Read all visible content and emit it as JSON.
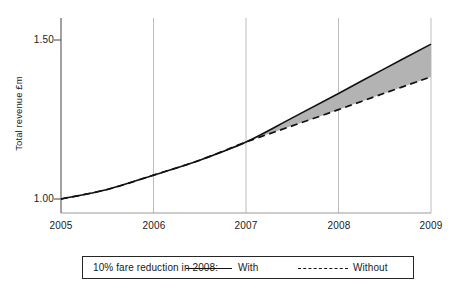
{
  "chart_data": {
    "type": "line",
    "title": "",
    "xlabel": "",
    "ylabel": "Total revenue £m",
    "xlim": [
      2005,
      2009
    ],
    "ylim": [
      0.95,
      1.56
    ],
    "grid": "vertical-only",
    "yticks": [
      1.0,
      1.5
    ],
    "ytick_labels": [
      "1.00",
      "1.50"
    ],
    "xticks": [
      2005,
      2006,
      2007,
      2008,
      2009
    ],
    "xtick_labels": [
      "2005",
      "2006",
      "2007",
      "2008",
      "2009"
    ],
    "legend_position": "below-plot-boxed",
    "shaded_region": {
      "label": "difference between With and Without",
      "fill_color": "#b3b3b3",
      "x_start": 2007,
      "x_end": 2009
    },
    "x": [
      2005,
      2005.5,
      2006,
      2006.5,
      2007,
      2007.5,
      2008,
      2008.5,
      2009
    ],
    "series": [
      {
        "name": "With",
        "style": "solid",
        "color": "#111111",
        "values": [
          1.0,
          1.03,
          1.075,
          1.122,
          1.179,
          1.255,
          1.332,
          1.41,
          1.487
        ]
      },
      {
        "name": "Without",
        "style": "dashed",
        "color": "#111111",
        "values": [
          1.0,
          1.03,
          1.075,
          1.122,
          1.179,
          1.23,
          1.281,
          1.333,
          1.384
        ]
      }
    ],
    "annotations": []
  },
  "legend": {
    "title": "10% fare reduction in 2008:",
    "with_label": "With",
    "without_label": "Without"
  },
  "axis": {
    "y_axis_title": "Total revenue £m"
  }
}
